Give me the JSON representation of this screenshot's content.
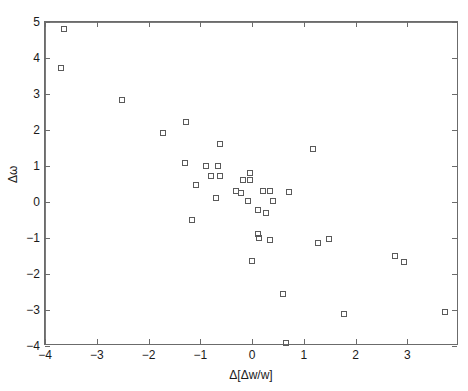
{
  "chart_data": {
    "type": "scatter",
    "title": "",
    "xlabel": "Δ[Δw/w]",
    "ylabel": "Δω",
    "xlim": [
      -4,
      4
    ],
    "ylim": [
      -4,
      5
    ],
    "xticks": [
      -4,
      -3,
      -2,
      -1,
      0,
      1,
      2,
      3
    ],
    "yticks": [
      -4,
      -3,
      -2,
      -1,
      0,
      1,
      2,
      3,
      4,
      5
    ],
    "xtick_labels": [
      "-4",
      "-3",
      "-2",
      "-1",
      "0",
      "1",
      "2",
      "3"
    ],
    "ytick_labels": [
      "-4",
      "-3",
      "-2",
      "-1",
      "0",
      "1",
      "2",
      "3",
      "4",
      "5"
    ],
    "grid": false,
    "legend": null,
    "marker": "open-square",
    "marker_color": "#5a5a5a",
    "reference_lines": [
      {
        "axis": "horizontal",
        "value": 0
      },
      {
        "axis": "vertical",
        "value": 0
      }
    ],
    "points": [
      {
        "x": -3.63,
        "y": 4.8
      },
      {
        "x": -3.7,
        "y": 3.72
      },
      {
        "x": -2.52,
        "y": 2.82
      },
      {
        "x": -1.72,
        "y": 1.92
      },
      {
        "x": -1.28,
        "y": 2.22
      },
      {
        "x": -1.3,
        "y": 1.08
      },
      {
        "x": -0.62,
        "y": 1.6
      },
      {
        "x": -0.88,
        "y": 1.0
      },
      {
        "x": -0.66,
        "y": 1.0
      },
      {
        "x": -0.8,
        "y": 0.72
      },
      {
        "x": -0.62,
        "y": 0.72
      },
      {
        "x": -1.08,
        "y": 0.48
      },
      {
        "x": -0.7,
        "y": 0.12
      },
      {
        "x": -0.18,
        "y": 0.62
      },
      {
        "x": -0.04,
        "y": 0.8
      },
      {
        "x": -0.04,
        "y": 0.62
      },
      {
        "x": -0.3,
        "y": 0.3
      },
      {
        "x": -0.22,
        "y": 0.26
      },
      {
        "x": 0.22,
        "y": 0.3
      },
      {
        "x": 0.34,
        "y": 0.3
      },
      {
        "x": 0.72,
        "y": 0.28
      },
      {
        "x": 1.18,
        "y": 1.48
      },
      {
        "x": -0.08,
        "y": 0.02
      },
      {
        "x": 0.4,
        "y": 0.02
      },
      {
        "x": 0.12,
        "y": -0.22
      },
      {
        "x": 0.28,
        "y": -0.3
      },
      {
        "x": -1.16,
        "y": -0.5
      },
      {
        "x": 0.12,
        "y": -0.88
      },
      {
        "x": 0.14,
        "y": -1.0
      },
      {
        "x": 0.34,
        "y": -1.06
      },
      {
        "x": 1.28,
        "y": -1.14
      },
      {
        "x": 1.48,
        "y": -1.02
      },
      {
        "x": 2.76,
        "y": -1.5
      },
      {
        "x": 2.94,
        "y": -1.66
      },
      {
        "x": 0.0,
        "y": -1.65
      },
      {
        "x": 0.6,
        "y": -2.55
      },
      {
        "x": 1.78,
        "y": -3.12
      },
      {
        "x": 3.72,
        "y": -3.05
      },
      {
        "x": 0.66,
        "y": -3.92
      }
    ]
  }
}
